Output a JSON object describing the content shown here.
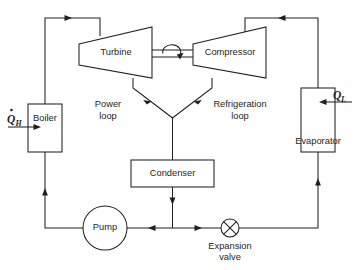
{
  "diagram": {
    "components": {
      "turbine": {
        "label": "Turbine",
        "name": "turbine"
      },
      "compressor": {
        "label": "Compressor",
        "name": "compressor"
      },
      "boiler": {
        "label": "Boiler",
        "name": "boiler"
      },
      "evaporator": {
        "label": "Evaporator",
        "name": "evaporator"
      },
      "condenser": {
        "label": "Condenser",
        "name": "condenser"
      },
      "pump": {
        "label": "Pump",
        "name": "pump"
      },
      "expansion_valve": {
        "label_line1": "Expansion",
        "label_line2": "valve",
        "name": "expansion-valve"
      }
    },
    "loop_labels": {
      "power": {
        "line1": "Power",
        "line2": "loop"
      },
      "refrigeration": {
        "line1": "Refrigeration",
        "line2": "loop"
      }
    },
    "heat_flows": {
      "high": {
        "symbol": "Q",
        "subscript": "H",
        "has_dot": true
      },
      "low": {
        "symbol": "Q",
        "subscript": "L",
        "has_dot": false
      }
    },
    "shaft": {
      "name": "turbine-compressor-shaft",
      "rotation_indicator": true
    },
    "colors": {
      "line": "#231f20",
      "fill": "#ffffff",
      "background": "#ffffff"
    }
  }
}
